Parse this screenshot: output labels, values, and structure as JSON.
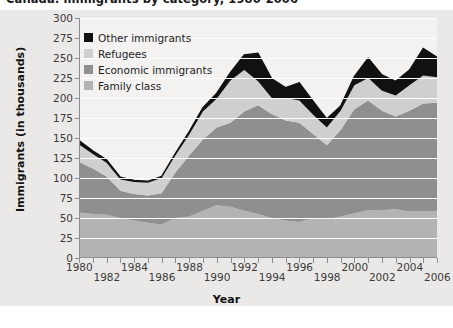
{
  "title": "Canada: immigrants by category, 1980-2006",
  "axes": {
    "ylabel": "Immigrants (in thousands)",
    "xlabel": "Year",
    "yticks": [
      0,
      25,
      50,
      75,
      100,
      125,
      150,
      175,
      200,
      225,
      250,
      275,
      300
    ],
    "ymin": 0,
    "ymax": 300,
    "xticks_top": [
      "1980",
      "1984",
      "1988",
      "1992",
      "1996",
      "2000",
      "2004"
    ],
    "xticks_bottom": [
      "1982",
      "1986",
      "1990",
      "1994",
      "1998",
      "2002",
      "2006"
    ]
  },
  "legend": [
    {
      "label": "Other immigrants",
      "color": "#111111"
    },
    {
      "label": "Refugees",
      "color": "#cfcfcf"
    },
    {
      "label": "Economic immigrants",
      "color": "#8f8f8f"
    },
    {
      "label": "Family class",
      "color": "#b3b3b3"
    }
  ],
  "colors": {
    "family_class": "#b3b3b3",
    "economic_immigrants": "#8f8f8f",
    "refugees": "#cfcfcf",
    "other_immigrants": "#111111",
    "panel_bg": "#f3f2f1",
    "plate_bg": "#ebe9e7",
    "grid": "#ffffff",
    "axis": "#8e8e8e"
  },
  "chart_data": {
    "type": "area",
    "stacked": true,
    "title": "Canada: immigrants by category, 1980-2006",
    "xlabel": "Year",
    "ylabel": "Immigrants (in thousands)",
    "ylim": [
      0,
      300
    ],
    "grid": true,
    "legend_position": "upper-left-inside",
    "x": [
      1980,
      1981,
      1982,
      1983,
      1984,
      1985,
      1986,
      1987,
      1988,
      1989,
      1990,
      1991,
      1992,
      1993,
      1994,
      1995,
      1996,
      1997,
      1998,
      1999,
      2000,
      2001,
      2002,
      2003,
      2004,
      2005,
      2006
    ],
    "series": [
      {
        "name": "Family class",
        "values": [
          57,
          55,
          54,
          50,
          47,
          44,
          42,
          50,
          52,
          59,
          66,
          64,
          59,
          55,
          50,
          47,
          45,
          50,
          48,
          52,
          56,
          60,
          60,
          61,
          58,
          58,
          59
        ]
      },
      {
        "name": "Economic immigrants",
        "values": [
          63,
          57,
          48,
          34,
          33,
          34,
          39,
          57,
          76,
          89,
          97,
          105,
          124,
          136,
          130,
          125,
          124,
          105,
          93,
          108,
          130,
          137,
          124,
          116,
          126,
          135,
          135
        ]
      },
      {
        "name": "Refugees",
        "values": [
          22,
          18,
          17,
          14,
          15,
          16,
          19,
          21,
          26,
          35,
          36,
          53,
          52,
          30,
          20,
          28,
          28,
          24,
          22,
          24,
          30,
          28,
          25,
          26,
          32,
          35,
          32
        ]
      },
      {
        "name": "Other immigrants",
        "values": [
          5,
          4,
          4,
          3,
          2,
          2,
          2,
          3,
          4,
          5,
          7,
          10,
          19,
          35,
          24,
          13,
          22,
          17,
          11,
          6,
          11,
          25,
          20,
          18,
          19,
          34,
          25
        ]
      }
    ],
    "totals": [
      147,
      134,
      123,
      101,
      97,
      96,
      102,
      131,
      158,
      188,
      206,
      232,
      254,
      256,
      224,
      213,
      219,
      196,
      174,
      190,
      227,
      250,
      229,
      221,
      235,
      262,
      251
    ]
  }
}
